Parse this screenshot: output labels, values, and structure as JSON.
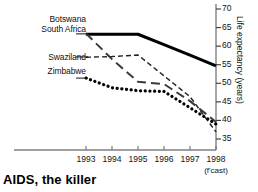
{
  "chart_data": {
    "type": "line",
    "title": "AIDS, the killer",
    "xlabel": "",
    "ylabel": "Life expectancy (years)",
    "x": [
      1993,
      1994,
      1995,
      1996,
      1997,
      1998
    ],
    "xtick_labels": [
      "1993",
      "1994",
      "1995",
      "1996",
      "1997",
      "1998"
    ],
    "forecast_note": "(f'cast)",
    "forecast_year": "1998",
    "ylim": [
      32,
      70
    ],
    "yticks": [
      35,
      40,
      45,
      50,
      55,
      60,
      65,
      70
    ],
    "ytick_labels": [
      "35",
      "40",
      "45",
      "50",
      "55",
      "60",
      "65",
      "70"
    ],
    "y_axis_position": "right",
    "grid": false,
    "legend_position": "inline-left",
    "series": [
      {
        "name": "Botswana",
        "style": "solid-thick",
        "color": "#000000",
        "values": [
          63.2,
          63.2,
          63.2,
          60.4,
          57.6,
          54.7
        ]
      },
      {
        "name": "South Africa",
        "style": "long-dash",
        "color": "#3a3a3a",
        "values": [
          63.4,
          56.5,
          50.4,
          49.8,
          45.2,
          39.6
        ]
      },
      {
        "name": "Swaziland",
        "style": "short-dash",
        "color": "#222222",
        "values": [
          57.0,
          57.2,
          57.6,
          52.0,
          46.4,
          36.9
        ]
      },
      {
        "name": "Zimbabwe",
        "style": "dotted-thick",
        "color": "#000000",
        "values": [
          51.4,
          48.8,
          48.0,
          47.8,
          43.4,
          39.0
        ]
      }
    ]
  },
  "labels": {
    "botswana": "Botswana",
    "south_africa": "South Africa",
    "swaziland": "Swaziland",
    "zimbabwe": "Zimbabwe"
  }
}
